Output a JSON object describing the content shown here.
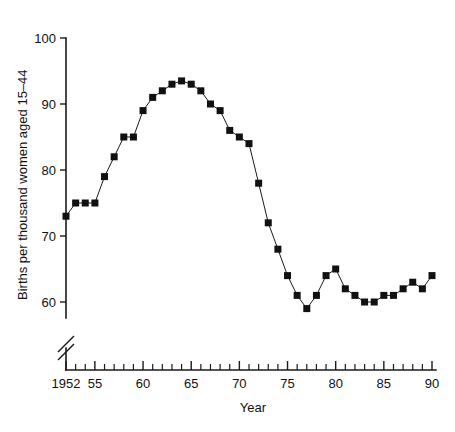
{
  "chart_data": {
    "type": "line",
    "title": "",
    "xlabel": "Year",
    "ylabel": "Births per thousand women aged 15–44",
    "xlim": [
      1952,
      1990
    ],
    "ylim": [
      57,
      100
    ],
    "grid": false,
    "legend": "none",
    "axis_break_y": true,
    "marker": "filled-square",
    "x_tick_labels": [
      "1952",
      "55",
      "60",
      "65",
      "70",
      "75",
      "80",
      "85",
      "90"
    ],
    "x_tick_values": [
      1952,
      1955,
      1960,
      1965,
      1970,
      1975,
      1980,
      1985,
      1990
    ],
    "x_minor_tick_step": 1,
    "y_tick_labels": [
      "60",
      "70",
      "80",
      "90",
      "100"
    ],
    "y_tick_values": [
      60,
      70,
      80,
      90,
      100
    ],
    "x": [
      1952,
      1953,
      1954,
      1955,
      1956,
      1957,
      1958,
      1959,
      1960,
      1961,
      1962,
      1963,
      1964,
      1965,
      1966,
      1967,
      1968,
      1969,
      1970,
      1971,
      1972,
      1973,
      1974,
      1975,
      1976,
      1977,
      1978,
      1979,
      1980,
      1981,
      1982,
      1983,
      1984,
      1985,
      1986,
      1987,
      1988,
      1989,
      1990
    ],
    "values": [
      73,
      75,
      75,
      75,
      79,
      82,
      85,
      85,
      89,
      91,
      92,
      93,
      93.5,
      93,
      92,
      90,
      89,
      86,
      85,
      84,
      78,
      72,
      68,
      64,
      61,
      59,
      61,
      64,
      65,
      62,
      61,
      60,
      60,
      61,
      61,
      62,
      63,
      62,
      64
    ],
    "series": [
      {
        "name": "Births per thousand women aged 15-44",
        "values": [
          73,
          75,
          75,
          75,
          79,
          82,
          85,
          85,
          89,
          91,
          92,
          93,
          93.5,
          93,
          92,
          90,
          89,
          86,
          85,
          84,
          78,
          72,
          68,
          64,
          61,
          59,
          61,
          64,
          65,
          62,
          61,
          60,
          60,
          61,
          61,
          62,
          63,
          62,
          64
        ]
      }
    ]
  },
  "colors": {
    "axis": "#1a1a1a",
    "line": "#1a1a1a",
    "marker": "#111111",
    "background": "#ffffff"
  }
}
